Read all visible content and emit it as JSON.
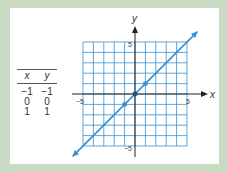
{
  "table": {
    "headers": [
      "x",
      "y"
    ],
    "rows": [
      [
        "−1",
        "−1"
      ],
      [
        "0",
        "0"
      ],
      [
        "1",
        "1"
      ]
    ]
  },
  "chart_data": {
    "type": "line",
    "title": "",
    "xlabel": "x",
    "ylabel": "y",
    "xlim": [
      -5,
      5
    ],
    "ylim": [
      -5,
      5
    ],
    "grid": true,
    "x_ticks": [
      -5,
      5
    ],
    "y_ticks": [
      5,
      -5
    ],
    "tick_labels": {
      "x_left": "−5",
      "x_right": "5",
      "y_top": "5",
      "y_bottom": "−5"
    },
    "series": [
      {
        "name": "y = x",
        "x": [
          -6,
          6
        ],
        "y": [
          -6,
          6
        ],
        "points": [
          [
            -1,
            -1
          ],
          [
            0,
            0
          ],
          [
            1,
            1
          ]
        ],
        "color": "#3a8fd0"
      }
    ],
    "legend": null
  },
  "colors": {
    "background": "#c9dcc3",
    "panel": "#ffffff",
    "grid": "#3a8fd0",
    "line": "#3a8fd0",
    "axis": "#222222"
  }
}
